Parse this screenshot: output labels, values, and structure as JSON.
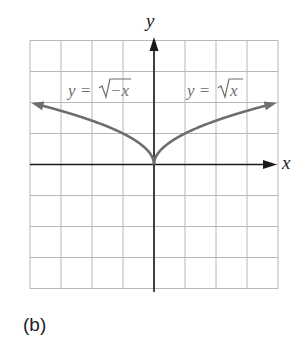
{
  "chart_data": {
    "type": "line",
    "title": "",
    "xlabel": "x",
    "ylabel": "y",
    "xlim": [
      -4,
      4
    ],
    "ylim": [
      -4,
      4
    ],
    "grid": true,
    "grid_step": 1,
    "series": [
      {
        "name": "y = √−x",
        "function": "sqrt(-x)",
        "x": [
          -3.9,
          -3,
          -2,
          -1,
          -0.25,
          0
        ],
        "values": [
          1.97,
          1.73,
          1.41,
          1.0,
          0.5,
          0
        ]
      },
      {
        "name": "y = √x",
        "function": "sqrt(x)",
        "x": [
          0,
          0.25,
          1,
          2,
          3,
          3.9
        ],
        "values": [
          0,
          0.5,
          1.0,
          1.41,
          1.73,
          1.97
        ]
      }
    ],
    "annotations": [
      {
        "text": "y = √−x",
        "position": "upper-left"
      },
      {
        "text": "y = √x",
        "position": "upper-right"
      }
    ],
    "colors": {
      "curve": "#6e6e6e",
      "axis": "#1a1a1a",
      "grid": "#b8b8b8"
    }
  },
  "labels": {
    "x_axis": "x",
    "y_axis": "y",
    "left_curve_lhs": "y = ",
    "left_curve_rad": "−x",
    "right_curve_lhs": "y = ",
    "right_curve_rad": "x",
    "caption": "(b)"
  }
}
